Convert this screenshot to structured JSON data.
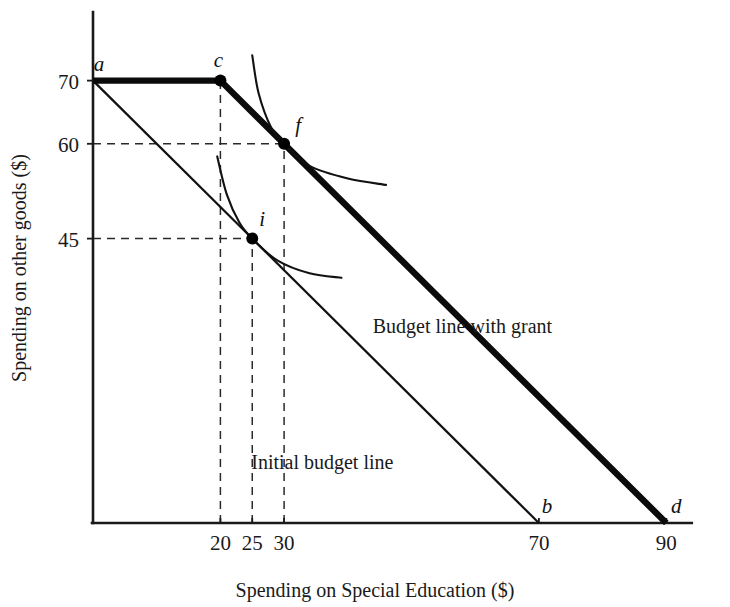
{
  "chart_data": {
    "type": "line",
    "title": "",
    "xlabel": "Spending on Special Education ($)",
    "ylabel": "Spending on other goods ($)",
    "xlim": [
      0,
      94
    ],
    "ylim": [
      0,
      81
    ],
    "grid": false,
    "legend_position": "inline-annotations",
    "xticks": [
      {
        "value": 20,
        "label": "20"
      },
      {
        "value": 25,
        "label": "25"
      },
      {
        "value": 30,
        "label": "30"
      },
      {
        "value": 70,
        "label": "70"
      },
      {
        "value": 90,
        "label": "90"
      }
    ],
    "yticks": [
      {
        "value": 45,
        "label": "45"
      },
      {
        "value": 60,
        "label": "60"
      },
      {
        "value": 70,
        "label": "70"
      }
    ],
    "series": [
      {
        "name": "Initial budget line",
        "style": "thin-solid",
        "points": [
          [
            0,
            70
          ],
          [
            70,
            0
          ]
        ]
      },
      {
        "name": "Budget line with grant",
        "style": "thick-solid",
        "points": [
          [
            0,
            70
          ],
          [
            20,
            70
          ],
          [
            90,
            0
          ]
        ]
      },
      {
        "name": "Higher indifference curve (through f)",
        "style": "thin-curve",
        "points": [
          [
            25,
            74
          ],
          [
            26,
            68
          ],
          [
            28,
            62.5
          ],
          [
            30,
            60
          ],
          [
            34,
            56.5
          ],
          [
            40,
            54.5
          ],
          [
            46,
            53.5
          ]
        ]
      },
      {
        "name": "Lower indifference curve (through i)",
        "style": "thin-curve",
        "points": [
          [
            19.5,
            58
          ],
          [
            21,
            52
          ],
          [
            23,
            47.5
          ],
          [
            25,
            45
          ],
          [
            29,
            41.5
          ],
          [
            34,
            39.5
          ],
          [
            39,
            38.8
          ]
        ]
      }
    ],
    "points": [
      {
        "id": "a",
        "label": "a",
        "x": 0,
        "y": 70,
        "marker": false,
        "label_dx": 6,
        "label_dy": -10
      },
      {
        "id": "c",
        "label": "c",
        "x": 20,
        "y": 70,
        "marker": true,
        "label_dx": -2,
        "label_dy": -14
      },
      {
        "id": "f",
        "label": "f",
        "x": 30,
        "y": 60,
        "marker": true,
        "label_dx": 14,
        "label_dy": -12
      },
      {
        "id": "i",
        "label": "i",
        "x": 25,
        "y": 45,
        "marker": true,
        "label_dx": 10,
        "label_dy": -13
      },
      {
        "id": "b",
        "label": "b",
        "x": 70,
        "y": 0,
        "marker": false,
        "label_dx": 8,
        "label_dy": -10
      },
      {
        "id": "d",
        "label": "d",
        "x": 90,
        "y": 0,
        "marker": false,
        "label_dx": 10,
        "label_dy": -10
      }
    ],
    "guides": [
      {
        "name": "guide-c-vertical",
        "from": [
          20,
          0
        ],
        "to": [
          20,
          70
        ]
      },
      {
        "name": "guide-f-vertical",
        "from": [
          30,
          0
        ],
        "to": [
          30,
          60
        ]
      },
      {
        "name": "guide-f-horizontal",
        "from": [
          0,
          60
        ],
        "to": [
          30,
          60
        ]
      },
      {
        "name": "guide-i-vertical",
        "from": [
          25,
          0
        ],
        "to": [
          25,
          45
        ]
      },
      {
        "name": "guide-i-horizontal",
        "from": [
          0,
          45
        ],
        "to": [
          25,
          45
        ]
      }
    ],
    "annotations": [
      {
        "name": "budget-line-with-grant-label",
        "text": "Budget line with grant",
        "x": 58,
        "y": 30
      },
      {
        "name": "initial-budget-line-label",
        "text": "Initial budget line",
        "x": 36,
        "y": 8.5
      }
    ]
  }
}
